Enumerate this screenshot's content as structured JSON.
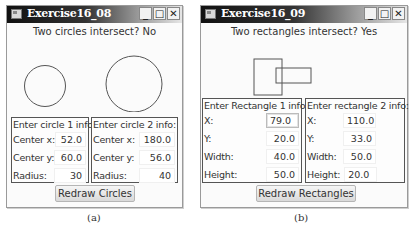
{
  "window_a": {
    "title": "Exercise16_08",
    "controls": {
      "minimize": "_",
      "maximize": "□",
      "close": "✕"
    },
    "status": "Two circles intersect? No",
    "circles": [
      {
        "cx": 38,
        "cy": 46,
        "r": 20.5
      },
      {
        "cx": 127,
        "cy": 44,
        "r": 28
      }
    ],
    "panels": [
      {
        "title": "Enter circle 1 info:",
        "rows": [
          {
            "label": "Center x:",
            "value": "52.0"
          },
          {
            "label": "Center y:",
            "value": "60.0"
          },
          {
            "label": "Radius:",
            "value": "30"
          }
        ]
      },
      {
        "title": "Enter circle 2 info:",
        "rows": [
          {
            "label": "Center x:",
            "value": "180.0"
          },
          {
            "label": "Center y:",
            "value": "56.0"
          },
          {
            "label": "Radius:",
            "value": "40"
          }
        ]
      }
    ],
    "button": "Redraw Circles",
    "caption": "(a)"
  },
  "window_b": {
    "title": "Exercise16_09",
    "controls": {
      "minimize": "_",
      "maximize": "□",
      "close": "✕"
    },
    "status": "Two rectangles intersect? Yes",
    "rects": [
      {
        "x": 53,
        "y": 19,
        "w": 28,
        "h": 36
      },
      {
        "x": 75,
        "y": 28,
        "w": 35,
        "h": 15
      }
    ],
    "panels": [
      {
        "title": "Enter Rectangle 1 info:",
        "rows": [
          {
            "label": "X:",
            "value": "79.0"
          },
          {
            "label": "Y:",
            "value": "20.0"
          },
          {
            "label": "Width:",
            "value": "40.0"
          },
          {
            "label": "Height:",
            "value": "50.0"
          }
        ]
      },
      {
        "title": "Enter rectangle 2 info:",
        "rows": [
          {
            "label": "X:",
            "value": "110.0"
          },
          {
            "label": "Y:",
            "value": "33.0"
          },
          {
            "label": "Width:",
            "value": "50.0"
          },
          {
            "label": "Height:",
            "value": "20.0"
          }
        ]
      }
    ],
    "button": "Redraw Rectangles",
    "caption": "(b)"
  }
}
